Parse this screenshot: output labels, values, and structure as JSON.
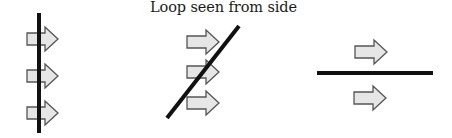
{
  "title": "Loop seen from side",
  "colors": {
    "line": "#111111",
    "arrow_fill": "#e6e6e6",
    "arrow_stroke": "#555555",
    "background": "#ffffff"
  },
  "panels": [
    {
      "name": "loop-perpendicular",
      "orientation": "vertical",
      "line": {
        "x1": 39,
        "y1": 13,
        "x2": 39,
        "y2": 133
      },
      "arrows": [
        {
          "x": 27,
          "y": 39,
          "len": 31
        },
        {
          "x": 27,
          "y": 76,
          "len": 31
        },
        {
          "x": 27,
          "y": 113,
          "len": 31
        }
      ]
    },
    {
      "name": "loop-tilted",
      "orientation": "diagonal",
      "line": {
        "x1": 167,
        "y1": 118,
        "x2": 239,
        "y2": 26
      },
      "arrows": [
        {
          "x": 187,
          "y": 42,
          "len": 32
        },
        {
          "x": 187,
          "y": 72,
          "len": 32
        },
        {
          "x": 187,
          "y": 103,
          "len": 32
        }
      ]
    },
    {
      "name": "loop-parallel",
      "orientation": "horizontal",
      "line": {
        "x1": 317,
        "y1": 73,
        "x2": 433,
        "y2": 73
      },
      "arrows": [
        {
          "x": 355,
          "y": 52,
          "len": 32
        },
        {
          "x": 354,
          "y": 98,
          "len": 32
        }
      ]
    }
  ]
}
